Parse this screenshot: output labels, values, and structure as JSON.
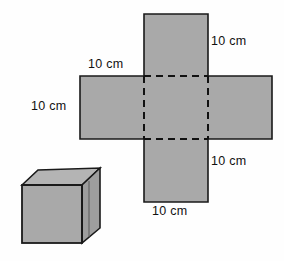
{
  "figure": {
    "background_color": "#fefefe",
    "fill_color": "#a9a9a9",
    "top_face_color": "#b4b4b4",
    "side_face_color": "#9e9e9e",
    "stroke_color": "#1a1a1a",
    "dashed_stroke_color": "#111111"
  },
  "net": {
    "description": "Cross-shaped net of a cube made of six squares",
    "squares": [
      {
        "name": "top-square",
        "x": 144,
        "y": 14,
        "w": 64,
        "h": 62,
        "dashed": false
      },
      {
        "name": "left-square",
        "x": 80,
        "y": 76,
        "w": 64,
        "h": 63,
        "dashed": false
      },
      {
        "name": "center-square",
        "x": 144,
        "y": 76,
        "w": 64,
        "h": 63,
        "dashed": true
      },
      {
        "name": "right-square",
        "x": 208,
        "y": 76,
        "w": 64,
        "h": 63,
        "dashed": false
      },
      {
        "name": "bottom-square",
        "x": 144,
        "y": 139,
        "w": 64,
        "h": 63,
        "dashed": false
      }
    ]
  },
  "cube": {
    "description": "Three-dimensional drawing of a cube",
    "front_face": [
      [
        22,
        185
      ],
      [
        82,
        185
      ],
      [
        82,
        243
      ],
      [
        22,
        243
      ]
    ],
    "top_face": [
      [
        22,
        185
      ],
      [
        38,
        170
      ],
      [
        100,
        168
      ],
      [
        82,
        185
      ]
    ],
    "right_face": [
      [
        82,
        185
      ],
      [
        100,
        168
      ],
      [
        100,
        228
      ],
      [
        82,
        243
      ]
    ]
  },
  "labels": [
    {
      "name": "label-top-right",
      "text": "10 cm",
      "x": 211,
      "y": 35
    },
    {
      "name": "label-top-left",
      "text": "10 cm",
      "x": 88,
      "y": 58
    },
    {
      "name": "label-left",
      "text": "10 cm",
      "x": 31,
      "y": 100
    },
    {
      "name": "label-bottom-right",
      "text": "10 cm",
      "x": 211,
      "y": 155
    },
    {
      "name": "label-bottom",
      "text": "10 cm",
      "x": 152,
      "y": 205
    }
  ]
}
